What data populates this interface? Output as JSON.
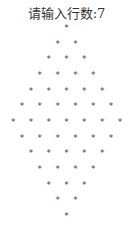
{
  "console": {
    "prompt_label": "请输入行数:",
    "prompt_value": "7",
    "prompt_text": "请输入行数:7",
    "star_char": "*",
    "rows": 7,
    "pattern_rows": [
      {
        "count": 1
      },
      {
        "count": 2
      },
      {
        "count": 3
      },
      {
        "count": 4
      },
      {
        "count": 5
      },
      {
        "count": 6
      },
      {
        "count": 7
      },
      {
        "count": 6
      },
      {
        "count": 5
      },
      {
        "count": 4
      },
      {
        "count": 3
      },
      {
        "count": 2
      },
      {
        "count": 1
      }
    ]
  },
  "colors": {
    "background": "#ffffff",
    "text": "#333333",
    "star": "#444444"
  },
  "layout": {
    "center_x": 66.5,
    "first_row_y": 28,
    "row_spacing": 15.67,
    "col_spacing": 17.8
  }
}
